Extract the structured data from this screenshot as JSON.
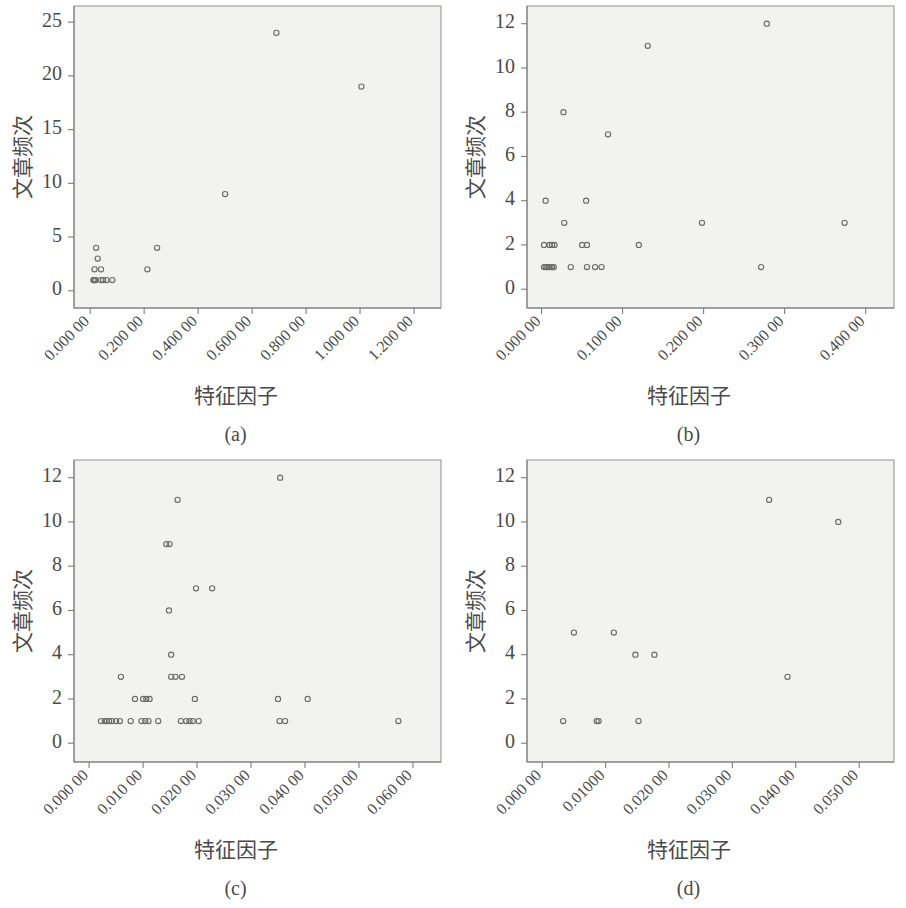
{
  "figure": {
    "background_color": "#ffffff",
    "plot_background_color": "#f2f2f0",
    "marker_color": "#6d6d6d",
    "axis_color": "#7d7d7d"
  },
  "panels": [
    {
      "id": "a",
      "caption": "(a)",
      "xlabel": "特征因子",
      "ylabel": "文章频次"
    },
    {
      "id": "b",
      "caption": "(b)",
      "xlabel": "特征因子",
      "ylabel": "文章频次"
    },
    {
      "id": "c",
      "caption": "(c)",
      "xlabel": "特征因子",
      "ylabel": "文章频次"
    },
    {
      "id": "d",
      "caption": "(d)",
      "xlabel": "特征因子",
      "ylabel": "文章频次"
    }
  ],
  "chart_data": [
    {
      "type": "scatter",
      "panel": "a",
      "title": "",
      "xlabel": "特征因子",
      "ylabel": "文章频次",
      "caption": "(a)",
      "grid": false,
      "legend": null,
      "xlim": [
        -0.06,
        1.3
      ],
      "ylim": [
        -1.6,
        26.5
      ],
      "xticks": [
        0,
        0.2,
        0.4,
        0.6,
        0.8,
        1.0,
        1.2
      ],
      "xtick_labels": [
        "0.000 00",
        "0.200 00",
        "0.400 00",
        "0.600 00",
        "0.800 00",
        "1.000 00",
        "1.200 00"
      ],
      "yticks": [
        0,
        5,
        10,
        15,
        20,
        25
      ],
      "ytick_labels": [
        "0",
        "5",
        "10",
        "15",
        "20",
        "25"
      ],
      "points": [
        {
          "x": 0.012,
          "y": 1
        },
        {
          "x": 0.014,
          "y": 1
        },
        {
          "x": 0.016,
          "y": 1
        },
        {
          "x": 0.02,
          "y": 1
        },
        {
          "x": 0.04,
          "y": 1
        },
        {
          "x": 0.048,
          "y": 1
        },
        {
          "x": 0.06,
          "y": 1
        },
        {
          "x": 0.082,
          "y": 1
        },
        {
          "x": 0.016,
          "y": 2
        },
        {
          "x": 0.04,
          "y": 2
        },
        {
          "x": 0.028,
          "y": 3
        },
        {
          "x": 0.022,
          "y": 4
        },
        {
          "x": 0.212,
          "y": 2
        },
        {
          "x": 0.248,
          "y": 4
        },
        {
          "x": 0.5,
          "y": 9
        },
        {
          "x": 0.69,
          "y": 24
        },
        {
          "x": 1.005,
          "y": 19
        }
      ]
    },
    {
      "type": "scatter",
      "panel": "b",
      "title": "",
      "xlabel": "特征因子",
      "ylabel": "文章频次",
      "caption": "(b)",
      "grid": false,
      "legend": null,
      "xlim": [
        -0.018,
        0.435
      ],
      "ylim": [
        -0.85,
        12.8
      ],
      "xticks": [
        0,
        0.1,
        0.2,
        0.3,
        0.4
      ],
      "xtick_labels": [
        "0.000 00",
        "0.100 00",
        "0.200 00",
        "0.300 00",
        "0.400 00"
      ],
      "yticks": [
        0,
        2,
        4,
        6,
        8,
        10,
        12
      ],
      "ytick_labels": [
        "0",
        "2",
        "4",
        "6",
        "8",
        "10",
        "12"
      ],
      "points": [
        {
          "x": 0.003,
          "y": 1
        },
        {
          "x": 0.005,
          "y": 1
        },
        {
          "x": 0.007,
          "y": 1
        },
        {
          "x": 0.009,
          "y": 1
        },
        {
          "x": 0.011,
          "y": 1
        },
        {
          "x": 0.013,
          "y": 1
        },
        {
          "x": 0.015,
          "y": 1
        },
        {
          "x": 0.036,
          "y": 1
        },
        {
          "x": 0.056,
          "y": 1
        },
        {
          "x": 0.066,
          "y": 1
        },
        {
          "x": 0.074,
          "y": 1
        },
        {
          "x": 0.271,
          "y": 1
        },
        {
          "x": 0.003,
          "y": 2
        },
        {
          "x": 0.01,
          "y": 2
        },
        {
          "x": 0.013,
          "y": 2
        },
        {
          "x": 0.016,
          "y": 2
        },
        {
          "x": 0.05,
          "y": 2
        },
        {
          "x": 0.056,
          "y": 2
        },
        {
          "x": 0.12,
          "y": 2
        },
        {
          "x": 0.028,
          "y": 3
        },
        {
          "x": 0.198,
          "y": 3
        },
        {
          "x": 0.374,
          "y": 3
        },
        {
          "x": 0.005,
          "y": 4
        },
        {
          "x": 0.055,
          "y": 4
        },
        {
          "x": 0.082,
          "y": 7
        },
        {
          "x": 0.027,
          "y": 8
        },
        {
          "x": 0.131,
          "y": 11
        },
        {
          "x": 0.278,
          "y": 12
        }
      ]
    },
    {
      "type": "scatter",
      "panel": "c",
      "title": "",
      "xlabel": "特征因子",
      "ylabel": "文章频次",
      "caption": "(c)",
      "grid": false,
      "legend": null,
      "xlim": [
        -0.0028,
        0.0652
      ],
      "ylim": [
        -0.85,
        12.8
      ],
      "xticks": [
        0,
        0.01,
        0.02,
        0.03,
        0.04,
        0.05,
        0.06
      ],
      "xtick_labels": [
        "0.000 00",
        "0.010 00",
        "0.020 00",
        "0.030 00",
        "0.040 00",
        "0.050 00",
        "0.060 00"
      ],
      "yticks": [
        0,
        2,
        4,
        6,
        8,
        10,
        12
      ],
      "ytick_labels": [
        "0",
        "2",
        "4",
        "6",
        "8",
        "10",
        "12"
      ],
      "points": [
        {
          "x": 0.0022,
          "y": 1
        },
        {
          "x": 0.0029,
          "y": 1
        },
        {
          "x": 0.0033,
          "y": 1
        },
        {
          "x": 0.0037,
          "y": 1
        },
        {
          "x": 0.0042,
          "y": 1
        },
        {
          "x": 0.005,
          "y": 1
        },
        {
          "x": 0.0057,
          "y": 1
        },
        {
          "x": 0.0077,
          "y": 1
        },
        {
          "x": 0.0097,
          "y": 1
        },
        {
          "x": 0.0104,
          "y": 1
        },
        {
          "x": 0.011,
          "y": 1
        },
        {
          "x": 0.0128,
          "y": 1
        },
        {
          "x": 0.017,
          "y": 1
        },
        {
          "x": 0.018,
          "y": 1
        },
        {
          "x": 0.0186,
          "y": 1
        },
        {
          "x": 0.0192,
          "y": 1
        },
        {
          "x": 0.0203,
          "y": 1
        },
        {
          "x": 0.0353,
          "y": 1
        },
        {
          "x": 0.0363,
          "y": 1
        },
        {
          "x": 0.0573,
          "y": 1
        },
        {
          "x": 0.0085,
          "y": 2
        },
        {
          "x": 0.01,
          "y": 2
        },
        {
          "x": 0.0106,
          "y": 2
        },
        {
          "x": 0.0112,
          "y": 2
        },
        {
          "x": 0.0196,
          "y": 2
        },
        {
          "x": 0.035,
          "y": 2
        },
        {
          "x": 0.0405,
          "y": 2
        },
        {
          "x": 0.0059,
          "y": 3
        },
        {
          "x": 0.0152,
          "y": 3
        },
        {
          "x": 0.016,
          "y": 3
        },
        {
          "x": 0.0172,
          "y": 3
        },
        {
          "x": 0.0152,
          "y": 4
        },
        {
          "x": 0.0148,
          "y": 6
        },
        {
          "x": 0.0198,
          "y": 7
        },
        {
          "x": 0.0228,
          "y": 7
        },
        {
          "x": 0.0143,
          "y": 9
        },
        {
          "x": 0.0149,
          "y": 9
        },
        {
          "x": 0.0164,
          "y": 11
        },
        {
          "x": 0.0354,
          "y": 12
        }
      ]
    },
    {
      "type": "scatter",
      "panel": "d",
      "title": "",
      "xlabel": "特征因子",
      "ylabel": "文章频次",
      "caption": "(d)",
      "grid": false,
      "legend": null,
      "xlim": [
        -0.0024,
        0.0555
      ],
      "ylim": [
        -0.85,
        12.8
      ],
      "xticks": [
        0,
        0.01,
        0.02,
        0.03,
        0.04,
        0.05
      ],
      "xtick_labels": [
        "0.000 00",
        "0.01000",
        "0.020 00",
        "0.030 00",
        "0.040 00",
        "0.050 00"
      ],
      "yticks": [
        0,
        2,
        4,
        6,
        8,
        10,
        12
      ],
      "ytick_labels": [
        "0",
        "2",
        "4",
        "6",
        "8",
        "10",
        "12"
      ],
      "points": [
        {
          "x": 0.0033,
          "y": 1
        },
        {
          "x": 0.0086,
          "y": 1
        },
        {
          "x": 0.0089,
          "y": 1
        },
        {
          "x": 0.0152,
          "y": 1
        },
        {
          "x": 0.005,
          "y": 5
        },
        {
          "x": 0.0113,
          "y": 5
        },
        {
          "x": 0.0147,
          "y": 4
        },
        {
          "x": 0.0177,
          "y": 4
        },
        {
          "x": 0.0387,
          "y": 3
        },
        {
          "x": 0.0358,
          "y": 11
        },
        {
          "x": 0.0467,
          "y": 10
        }
      ]
    }
  ]
}
